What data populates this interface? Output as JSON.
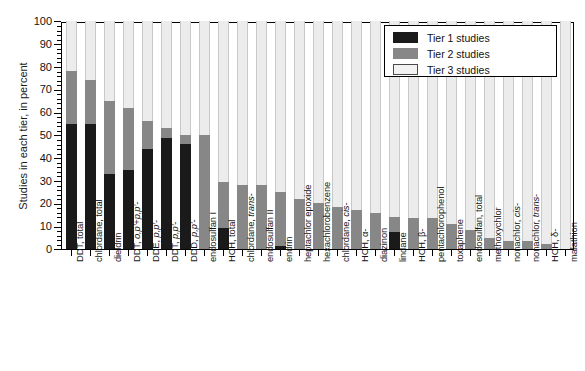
{
  "chart_data": {
    "type": "bar",
    "stacked": true,
    "title": "",
    "xlabel": "",
    "ylabel": "Studies in each tier, in percent",
    "ylim": [
      0,
      100
    ],
    "ytick_step": 10,
    "yminor_step": 2,
    "grid": false,
    "legend_position": "top-right",
    "ytick_labels": [
      "0",
      "10",
      "20",
      "30",
      "40",
      "50",
      "60",
      "70",
      "80",
      "90",
      "100"
    ],
    "categories": [
      "DDT, total",
      "chlordane, total",
      "dieldrin",
      "DDT, o,p'+p,p'-",
      "DDE, p,p'-",
      "DDT, p,p'-",
      "DDD, p,p'-",
      "endosulfan I",
      "HCH, total",
      "chlordane, trans-",
      "endosulfan II",
      "endrin",
      "heptachlor epoxide",
      "hexachlorobenzene",
      "chlordane, cis-",
      "HCH, α-",
      "diazinon",
      "lindane",
      "HCH, β-",
      "pentachlorophenol",
      "toxaphene",
      "endosulfan, total",
      "methoxychlor",
      "nonachlor, cis-",
      "nonachlor, trans-",
      "HCH, δ-",
      "malathion"
    ],
    "series": [
      {
        "name": "Tier 1 studies",
        "color": "#1a1a1a",
        "values": [
          55,
          55,
          33,
          34.5,
          44,
          48.5,
          46,
          0,
          9,
          0,
          0,
          1.5,
          0,
          0,
          0,
          0,
          0,
          7.5,
          0,
          0,
          0,
          0,
          0,
          0,
          0,
          0,
          0
        ]
      },
      {
        "name": "Tier 2 studies",
        "color": "#878787",
        "values": [
          23,
          19,
          32,
          27.5,
          12,
          4.5,
          4,
          50,
          20.5,
          28,
          28,
          23.5,
          22,
          20,
          18.5,
          17,
          16,
          6.5,
          13.5,
          13.5,
          11,
          8.5,
          5,
          3.5,
          3.5,
          2,
          0
        ]
      },
      {
        "name": "Tier 3 studies",
        "color": "#ececec",
        "values": [
          22,
          26,
          35,
          38,
          44,
          47,
          50,
          50,
          70.5,
          72,
          72,
          75,
          78,
          80,
          81.5,
          83,
          84,
          86,
          86.5,
          86.5,
          89,
          91.5,
          95,
          96.5,
          96.5,
          98,
          100
        ]
      }
    ],
    "totals": [
      {
        "category": "DDT, total",
        "tier1": 55,
        "tier2": 78
      },
      {
        "category": "chlordane, total",
        "tier1": 55,
        "tier2": 74
      },
      {
        "category": "dieldrin",
        "tier1": 33,
        "tier2": 65
      },
      {
        "category": "DDT, o,p'+p,p'-",
        "tier1": 34.5,
        "tier2": 62
      },
      {
        "category": "DDE, p,p'-",
        "tier1": 44,
        "tier2": 56
      },
      {
        "category": "DDT, p,p'-",
        "tier1": 48.5,
        "tier2": 53
      },
      {
        "category": "DDD, p,p'-",
        "tier1": 46,
        "tier2": 50
      },
      {
        "category": "endosulfan I",
        "tier1": 0,
        "tier2": 50
      },
      {
        "category": "HCH, total",
        "tier1": 9,
        "tier2": 29.5
      },
      {
        "category": "chlordane, trans-",
        "tier1": 0,
        "tier2": 28
      },
      {
        "category": "endosulfan II",
        "tier1": 0,
        "tier2": 28
      },
      {
        "category": "endrin",
        "tier1": 1.5,
        "tier2": 25
      },
      {
        "category": "heptachlor epoxide",
        "tier1": 0,
        "tier2": 22
      },
      {
        "category": "hexachlorobenzene",
        "tier1": 0,
        "tier2": 20
      },
      {
        "category": "chlordane, cis-",
        "tier1": 0,
        "tier2": 18.5
      },
      {
        "category": "HCH, α-",
        "tier1": 0,
        "tier2": 17
      },
      {
        "category": "diazinon",
        "tier1": 0,
        "tier2": 16
      },
      {
        "category": "lindane",
        "tier1": 7.5,
        "tier2": 14
      },
      {
        "category": "HCH, β-",
        "tier1": 0,
        "tier2": 13.5
      },
      {
        "category": "pentachlorophenol",
        "tier1": 0,
        "tier2": 13.5
      },
      {
        "category": "toxaphene",
        "tier1": 0,
        "tier2": 11
      },
      {
        "category": "endosulfan, total",
        "tier1": 0,
        "tier2": 8.5
      },
      {
        "category": "methoxychlor",
        "tier1": 0,
        "tier2": 5
      },
      {
        "category": "nonachlor, cis-",
        "tier1": 0,
        "tier2": 3.5
      },
      {
        "category": "nonachlor, trans-",
        "tier1": 0,
        "tier2": 3.5
      },
      {
        "category": "HCH, δ-",
        "tier1": 0,
        "tier2": 2
      },
      {
        "category": "malathion",
        "tier1": 0,
        "tier2": 0
      }
    ],
    "label_html": [
      "DDT, total",
      "chlordane, total",
      "dieldrin",
      "DDT, <i>o,p'</i>+<i>p,p'</i>-",
      "DDE, <i>p,p'</i>-",
      "DDT, <i>p,p'</i>-",
      "DDD, <i>p,p'</i>-",
      "endosulfan I",
      "HCH, total",
      "chlordane, <i>trans</i>-",
      "endosulfan II",
      "endrin",
      "heptachlor epoxide",
      "hexachlorobenzene",
      "chlordane, <i>cis</i>-",
      "HCH, α-",
      "diazinon",
      "lindane",
      "HCH, β-",
      "pentachlorophenol",
      "toxaphene",
      "endosulfan, total",
      "methoxychlor",
      "nonachlor, <i>cis</i>-",
      "nonachlor, <i>trans</i>-",
      "HCH, δ-",
      "malathion"
    ]
  },
  "legend": {
    "items": [
      {
        "label": "Tier 1 studies",
        "color": "#1a1a1a",
        "key": "t1"
      },
      {
        "label": "Tier 2 studies",
        "color": "#878787",
        "key": "t2"
      },
      {
        "label": "Tier 3 studies",
        "color": "#f2f2f2",
        "key": "t3"
      }
    ]
  }
}
